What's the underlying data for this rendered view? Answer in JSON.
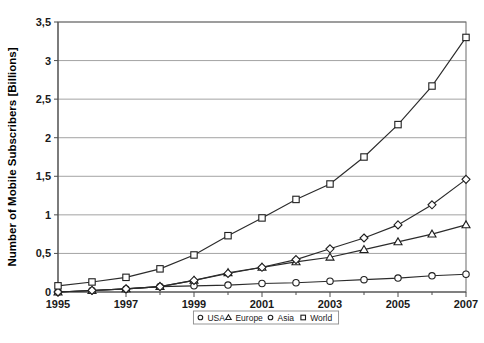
{
  "chart_data": {
    "type": "line",
    "title": "",
    "xlabel": "",
    "ylabel": "Number of Mobile Subscribers [Billions]",
    "xlim": [
      1995,
      2007
    ],
    "ylim": [
      0,
      3.5
    ],
    "ytick_labels": [
      "0",
      "0,5",
      "1",
      "1,5",
      "2",
      "2,5",
      "3",
      "3,5"
    ],
    "ytick_values": [
      0,
      0.5,
      1,
      1.5,
      2,
      2.5,
      3,
      3.5
    ],
    "xtick_labels": [
      "1995",
      "1997",
      "1999",
      "2001",
      "2003",
      "2005",
      "2007"
    ],
    "xtick_values": [
      1995,
      1997,
      1999,
      2001,
      2003,
      2005,
      2007
    ],
    "x": [
      1995,
      1996,
      1997,
      1998,
      1999,
      2000,
      2001,
      2002,
      2003,
      2004,
      2005,
      2006,
      2007
    ],
    "grid": "horizontal",
    "legend_position": "bottom-center",
    "series": [
      {
        "name": "USA",
        "marker": "circle",
        "values": [
          0.0,
          0.02,
          0.04,
          0.07,
          0.08,
          0.09,
          0.11,
          0.12,
          0.14,
          0.16,
          0.18,
          0.21,
          0.23
        ]
      },
      {
        "name": "Europe",
        "marker": "triangle",
        "values": [
          0.0,
          0.02,
          0.04,
          0.07,
          0.15,
          0.25,
          0.32,
          0.39,
          0.45,
          0.55,
          0.65,
          0.75,
          0.87
        ]
      },
      {
        "name": "Asia",
        "marker": "diamond",
        "values": [
          0.0,
          0.02,
          0.04,
          0.07,
          0.15,
          0.24,
          0.32,
          0.42,
          0.56,
          0.7,
          0.87,
          1.13,
          1.46
        ]
      },
      {
        "name": "World",
        "marker": "square",
        "values": [
          0.08,
          0.13,
          0.19,
          0.3,
          0.48,
          0.73,
          0.96,
          1.2,
          1.4,
          1.75,
          2.17,
          2.67,
          3.3
        ]
      }
    ]
  },
  "legend": {
    "entries": [
      {
        "label": "USA",
        "marker": "circle"
      },
      {
        "label": "Europe",
        "marker": "triangle"
      },
      {
        "label": "Asia",
        "marker": "circle"
      },
      {
        "label": "World",
        "marker": "square"
      }
    ]
  },
  "colors": {
    "background": "#ffffff",
    "line": "#2b2b2b",
    "grid": "#8c8c8c",
    "axis": "#4d4d4d",
    "marker_fill": "#ffffff",
    "text": "#1a1a1a"
  }
}
